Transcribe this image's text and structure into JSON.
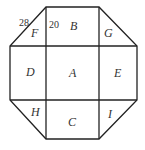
{
  "diagram": {
    "type": "octagon-grid",
    "stroke_color": "#222222",
    "regions": [
      {
        "id": "A",
        "label": "A",
        "position": "center"
      },
      {
        "id": "B",
        "label": "B",
        "position": "top"
      },
      {
        "id": "C",
        "label": "C",
        "position": "bottom"
      },
      {
        "id": "D",
        "label": "D",
        "position": "left"
      },
      {
        "id": "E",
        "label": "E",
        "position": "right"
      },
      {
        "id": "F",
        "label": "F",
        "position": "top-left-triangle"
      },
      {
        "id": "G",
        "label": "G",
        "position": "top-right-triangle"
      },
      {
        "id": "H",
        "label": "H",
        "position": "bottom-left-triangle"
      },
      {
        "id": "I",
        "label": "I",
        "position": "bottom-right-triangle"
      }
    ],
    "annotations": [
      {
        "text": "28",
        "attached_to": "F hypotenuse"
      },
      {
        "text": "20",
        "attached_to": "B left edge"
      }
    ]
  }
}
